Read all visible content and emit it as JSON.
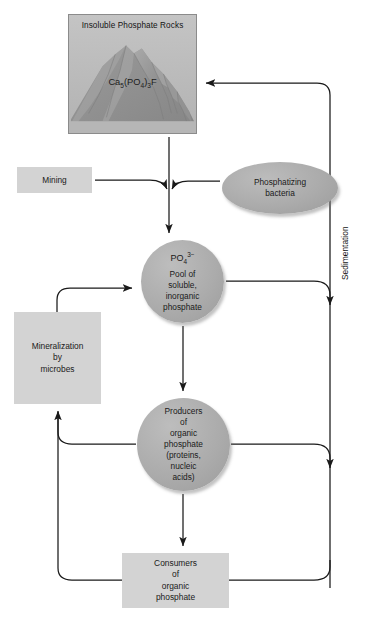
{
  "diagram": {
    "colors": {
      "box_fill": "#d3d3d3",
      "shape_fill": "#ababab",
      "rock_panel_fill": "#b9b9b9",
      "line": "#1a1a1a",
      "background": "#ffffff"
    }
  },
  "rock_panel": {
    "title": "Insoluble Phosphate Rocks",
    "formula_prefix": "Ca",
    "formula_sub1": "5",
    "formula_mid": "(PO",
    "formula_sub2": "4",
    "formula_close": ")",
    "formula_sub3": "3",
    "formula_suffix": "F",
    "formula_plain": "Ca5(PO4)3F"
  },
  "nodes": {
    "mining": {
      "label": "Mining"
    },
    "bacteria": {
      "line1": "Phosphatizing",
      "line2": "bacteria"
    },
    "pool": {
      "formula_prefix": "PO",
      "formula_sub": "4",
      "formula_sup": "3−",
      "line1": "Pool of",
      "line2": "soluble,",
      "line3": "inorganic",
      "line4": "phosphate"
    },
    "mineralization": {
      "line1": "Mineralization",
      "line2": "by",
      "line3": "microbes"
    },
    "producers": {
      "line1": "Producers",
      "line2": "of",
      "line3": "organic",
      "line4": "phosphate",
      "line5": "(proteins,",
      "line6": "nucleic",
      "line7": "acids)"
    },
    "consumers": {
      "line1": "Consumers",
      "line2": "of",
      "line3": "organic",
      "line4": "phosphate"
    }
  },
  "labels": {
    "sedimentation": "Sedimentation"
  },
  "flows": [
    {
      "from": "rock_panel",
      "to": "pool",
      "name": "weathering-arrow"
    },
    {
      "from": "mining",
      "to": "pool",
      "name": "mining-arrow"
    },
    {
      "from": "bacteria",
      "to": "pool",
      "name": "bacteria-arrow"
    },
    {
      "from": "pool",
      "to": "producers",
      "name": "uptake-arrow"
    },
    {
      "from": "producers",
      "to": "consumers",
      "name": "consumption-arrow"
    },
    {
      "from": "producers",
      "to": "mineralization",
      "name": "producer-decay-arrow"
    },
    {
      "from": "consumers",
      "to": "mineralization",
      "name": "consumer-decay-arrow"
    },
    {
      "from": "mineralization",
      "to": "pool",
      "name": "mineralization-release-arrow"
    },
    {
      "from": "pool",
      "to": "rock_panel",
      "name": "sedimentation-arrow-from-pool"
    },
    {
      "from": "producers",
      "to": "rock_panel",
      "name": "sedimentation-arrow-from-producers"
    },
    {
      "from": "consumers",
      "to": "rock_panel",
      "name": "sedimentation-arrow-from-consumers"
    }
  ]
}
